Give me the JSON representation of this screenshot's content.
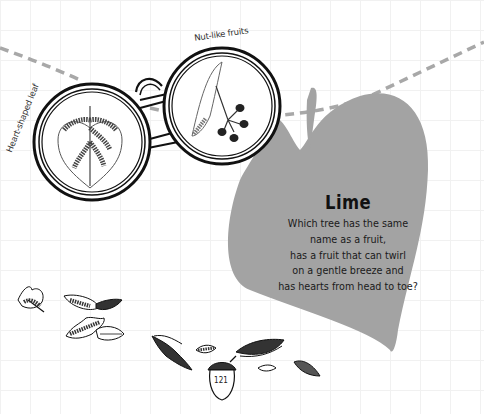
{
  "illustration": {
    "title": "Lime",
    "poem_lines": [
      "Which tree has the same",
      "name as a fruit,",
      "has a fruit that can twirl",
      "on a gentle breeze and",
      "has hearts from head to toe?"
    ],
    "labels": {
      "left_lens": "Heart-shaped leaf",
      "right_lens": "Nut-like fruits"
    },
    "page_number": "121",
    "colors": {
      "leaf_fill": "#a3a3a3",
      "string_dash": "#a8a8a8",
      "ink": "#111111"
    }
  }
}
